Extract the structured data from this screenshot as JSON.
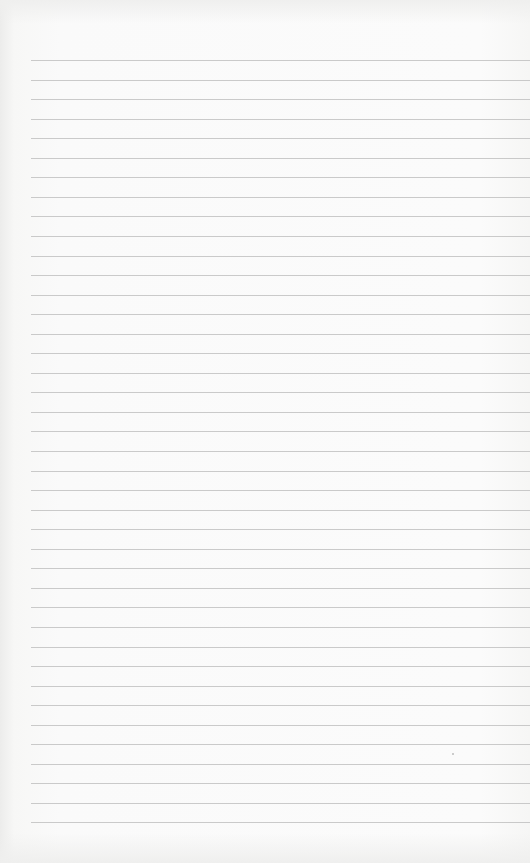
{
  "page": {
    "type": "lined-notebook-page",
    "background_color": "#fafafa",
    "rule_color": "#b9b9b9",
    "rule_count": 40,
    "first_rule_y": 60,
    "rule_spacing_px": 19.55,
    "rule_left_x": 31,
    "text": ""
  }
}
